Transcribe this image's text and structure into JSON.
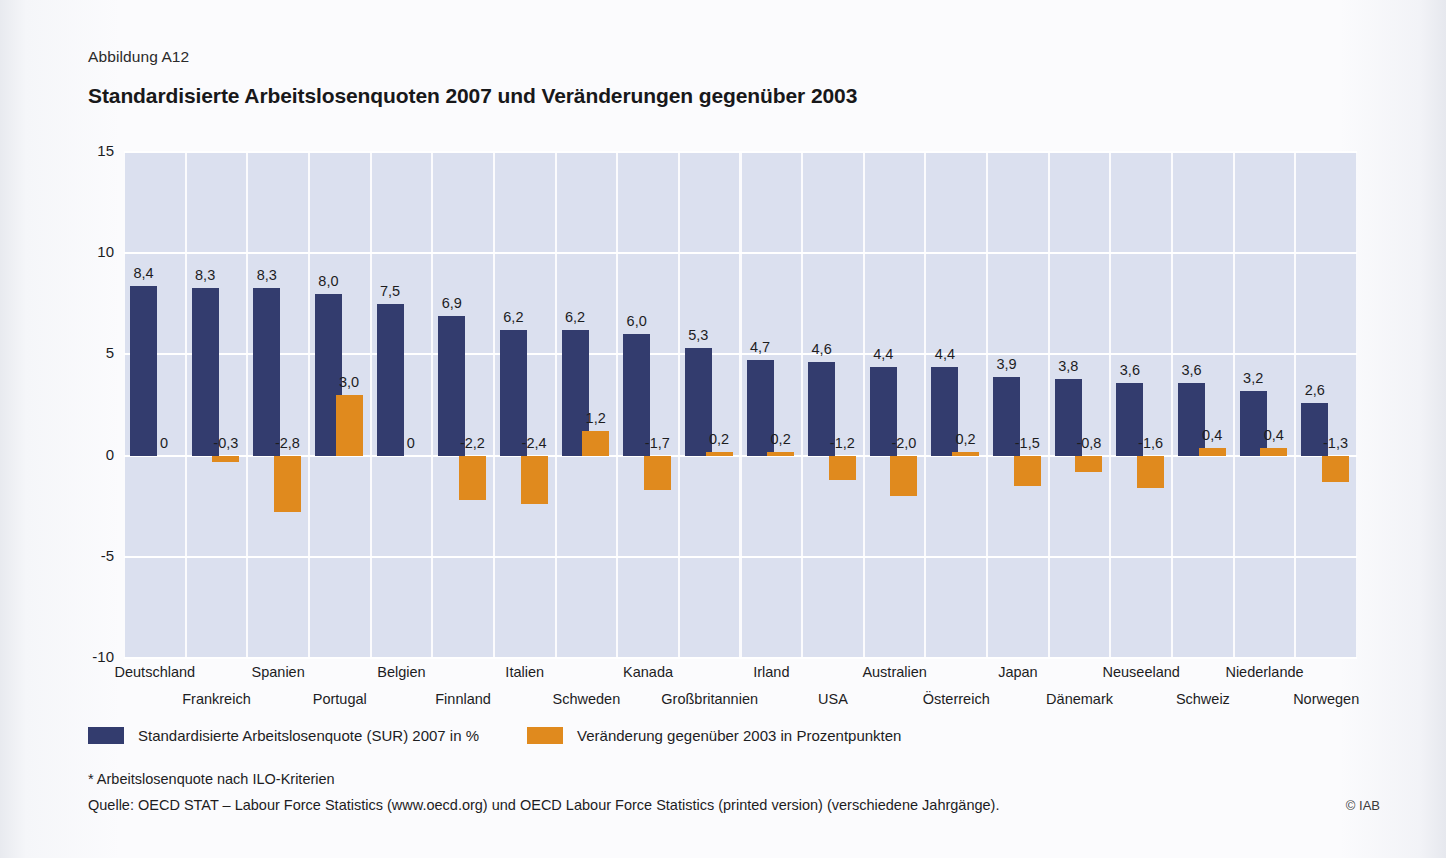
{
  "figure_label": "Abbildung A12",
  "legend": {
    "series1_label": "Standardisierte Arbeitslosenquote (SUR) 2007 in %",
    "series2_label": "Veränderung gegenüber 2003 in Prozentpunkten"
  },
  "footnote": "* Arbeitslosenquote nach ILO-Kriterien",
  "source": "Quelle: OECD STAT – Labour Force Statistics (www.oecd.org) und OECD Labour Force Statistics (printed version) (verschiedene Jahrgänge).",
  "credit": "© IAB",
  "colors": {
    "series1": "#333c6e",
    "series2": "#e08a1e",
    "plot_background": "#dbe0ef",
    "gridline": "#ffffff",
    "page_background": "#f8f9fb"
  },
  "chart_data": {
    "type": "bar",
    "title": "Standardisierte Arbeitslosenquoten 2007 und Veränderungen gegenüber 2003",
    "xlabel": "",
    "ylabel": "",
    "ylim": [
      -10,
      15
    ],
    "yticks": [
      15,
      10,
      5,
      0,
      -5,
      -10
    ],
    "ytick_labels": [
      "15",
      "10",
      "5",
      "0",
      "-5",
      "-10"
    ],
    "grid": true,
    "legend_position": "bottom",
    "categories": [
      "Deutschland",
      "Frankreich",
      "Spanien",
      "Portugal",
      "Belgien",
      "Finnland",
      "Italien",
      "Schweden",
      "Kanada",
      "Großbritannien",
      "Irland",
      "USA",
      "Australien",
      "Österreich",
      "Japan",
      "Dänemark",
      "Neuseeland",
      "Schweiz",
      "Niederlande",
      "Norwegen"
    ],
    "series": [
      {
        "name": "Standardisierte Arbeitslosenquote (SUR) 2007 in %",
        "color": "#333c6e",
        "values": [
          8.4,
          8.3,
          8.3,
          8.0,
          7.5,
          6.9,
          6.2,
          6.2,
          6.0,
          5.3,
          4.7,
          4.6,
          4.4,
          4.4,
          3.9,
          3.8,
          3.6,
          3.6,
          3.2,
          2.6
        ],
        "labels": [
          "8,4",
          "8,3",
          "8,3",
          "8,0",
          "7,5",
          "6,9",
          "6,2",
          "6,2",
          "6,0",
          "5,3",
          "4,7",
          "4,6",
          "4,4",
          "4,4",
          "3,9",
          "3,8",
          "3,6",
          "3,6",
          "3,2",
          "2,6"
        ]
      },
      {
        "name": "Veränderung gegenüber 2003 in Prozentpunkten",
        "color": "#e08a1e",
        "values": [
          0,
          -0.3,
          -2.8,
          3.0,
          0,
          -2.2,
          -2.4,
          1.2,
          -1.7,
          0.2,
          0.2,
          -1.2,
          -2.0,
          0.2,
          -1.5,
          -0.8,
          -1.6,
          0.4,
          0.4,
          -1.3
        ],
        "labels": [
          "0",
          "-0,3",
          "-2,8",
          "3,0",
          "0",
          "-2,2",
          "-2,4",
          "1,2",
          "-1,7",
          "0,2",
          "0,2",
          "-1,2",
          "-2,0",
          "0,2",
          "-1,5",
          "-0,8",
          "-1,6",
          "0,4",
          "0,4",
          "-1,3"
        ]
      }
    ]
  }
}
